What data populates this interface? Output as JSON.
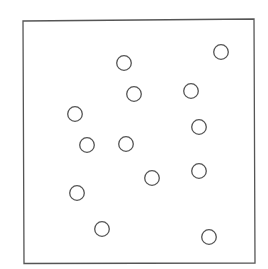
{
  "diagram": {
    "type": "dot-scatter-in-box",
    "canvas": {
      "width": 268,
      "height": 269
    },
    "colors": {
      "background": "#ffffff",
      "stroke": "#555555"
    },
    "box": {
      "x1": 23,
      "y1": 20,
      "x2": 255,
      "y2": 263,
      "stroke_width": 1.3
    },
    "circle_radius": 7.3,
    "circle_stroke_width": 1.3,
    "circles": [
      {
        "cx": 124,
        "cy": 63
      },
      {
        "cx": 134,
        "cy": 94
      },
      {
        "cx": 221,
        "cy": 52
      },
      {
        "cx": 191,
        "cy": 91
      },
      {
        "cx": 75,
        "cy": 114
      },
      {
        "cx": 87,
        "cy": 145
      },
      {
        "cx": 126,
        "cy": 144
      },
      {
        "cx": 199,
        "cy": 127
      },
      {
        "cx": 152,
        "cy": 178
      },
      {
        "cx": 199,
        "cy": 171
      },
      {
        "cx": 77,
        "cy": 193
      },
      {
        "cx": 102,
        "cy": 229
      },
      {
        "cx": 209,
        "cy": 237
      }
    ],
    "circle_count": 13
  }
}
